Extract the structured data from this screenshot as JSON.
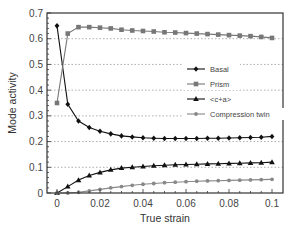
{
  "chart_data": {
    "type": "line",
    "title": "",
    "xlabel": "True strain",
    "ylabel": "Mode activity",
    "xlim": [
      0,
      0.105
    ],
    "ylim": [
      0,
      0.7
    ],
    "xticks": [
      0,
      0.02,
      0.04,
      0.06,
      0.08,
      0.1
    ],
    "xtick_labels": [
      "0",
      "0.02",
      "0.04",
      "0.06",
      "0.08",
      "0.1"
    ],
    "yticks": [
      0,
      0.1,
      0.2,
      0.3,
      0.4,
      0.5,
      0.6,
      0.7
    ],
    "ytick_labels": [
      "0",
      "0.1",
      "0.2",
      "0.3",
      "0.4",
      "0.5",
      "0.6",
      "0.7"
    ],
    "grid": "horizontal dotted",
    "legend_position": "center-right",
    "x": [
      0,
      0.005,
      0.01,
      0.015,
      0.02,
      0.025,
      0.03,
      0.035,
      0.04,
      0.045,
      0.05,
      0.055,
      0.06,
      0.065,
      0.07,
      0.075,
      0.08,
      0.085,
      0.09,
      0.095,
      0.1
    ],
    "series": [
      {
        "name": "Basal",
        "marker": "diamond",
        "color": "#111111",
        "values": [
          0.65,
          0.345,
          0.28,
          0.255,
          0.24,
          0.23,
          0.222,
          0.218,
          0.215,
          0.213,
          0.212,
          0.212,
          0.212,
          0.212,
          0.213,
          0.213,
          0.214,
          0.215,
          0.216,
          0.217,
          0.22
        ]
      },
      {
        "name": "Prism",
        "marker": "square",
        "color": "#777777",
        "values": [
          0.35,
          0.62,
          0.645,
          0.645,
          0.643,
          0.64,
          0.635,
          0.632,
          0.63,
          0.628,
          0.625,
          0.624,
          0.622,
          0.62,
          0.618,
          0.616,
          0.614,
          0.612,
          0.61,
          0.607,
          0.603
        ]
      },
      {
        "name": "<c+a>",
        "marker": "triangle",
        "color": "#111111",
        "values": [
          0,
          0.025,
          0.05,
          0.068,
          0.08,
          0.09,
          0.097,
          0.1,
          0.103,
          0.106,
          0.108,
          0.11,
          0.111,
          0.112,
          0.113,
          0.114,
          0.115,
          0.116,
          0.117,
          0.118,
          0.12
        ]
      },
      {
        "name": "Compression twin",
        "marker": "circle",
        "color": "#888888",
        "values": [
          0,
          0,
          0.003,
          0.008,
          0.014,
          0.02,
          0.025,
          0.03,
          0.034,
          0.037,
          0.04,
          0.042,
          0.044,
          0.046,
          0.047,
          0.048,
          0.049,
          0.05,
          0.051,
          0.052,
          0.053
        ]
      }
    ]
  }
}
